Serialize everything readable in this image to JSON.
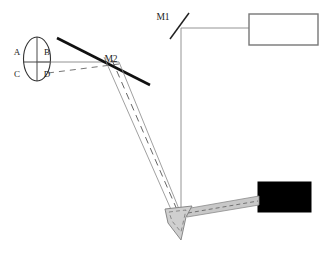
{
  "diagram": {
    "background_color": "#ffffff",
    "line_color": "#555555",
    "thick_line_color": "#111111",
    "fill_black": "#000000",
    "fill_gray": "#c9c9c9",
    "labels": {
      "sample_a": "A",
      "sample_b": "B",
      "sample_c": "C",
      "sample_d": "D",
      "mirror_1": "M1",
      "mirror_2": "M2"
    },
    "components": [
      {
        "name": "sample-ellipse",
        "type": "ellipse",
        "cx": 37,
        "cy": 59,
        "rx": 14,
        "ry": 22
      },
      {
        "name": "mirror-m1",
        "type": "line",
        "x1": 170,
        "y1": 39,
        "x2": 189,
        "y2": 13
      },
      {
        "name": "mirror-m2",
        "type": "thick-line",
        "x1": 57,
        "y1": 38,
        "x2": 150,
        "y2": 85
      },
      {
        "name": "detector-box",
        "type": "rect-outline",
        "x": 249,
        "y": 14,
        "w": 69,
        "h": 31
      },
      {
        "name": "source-box",
        "type": "rect-filled",
        "x": 258,
        "y": 182,
        "w": 53,
        "h": 30
      },
      {
        "name": "prism-wedge",
        "type": "polygon-filled"
      },
      {
        "name": "prism-arm",
        "type": "polygon-filled"
      }
    ],
    "beams": [
      {
        "name": "horizontal-beam-sample-to-m2",
        "style": "solid"
      },
      {
        "name": "dashed-beam-from-d",
        "style": "dashed"
      },
      {
        "name": "beam-m2-to-prism-left",
        "style": "solid"
      },
      {
        "name": "beam-m2-to-prism-right",
        "style": "solid"
      },
      {
        "name": "dashed-beam-m2-to-prism",
        "style": "dashed"
      },
      {
        "name": "vertical-beam-m1-to-prism",
        "style": "solid"
      },
      {
        "name": "horizontal-beam-m1-to-detector",
        "style": "solid"
      }
    ]
  }
}
